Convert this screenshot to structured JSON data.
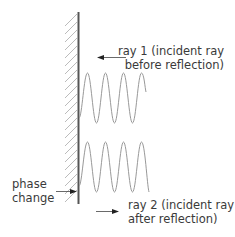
{
  "diagram": {
    "labels": {
      "ray1_line1": "ray 1 (incident ray",
      "ray1_line2": "before reflection)",
      "ray2_line1": "ray 2 (incident ray",
      "ray2_line2": "after reflection)",
      "phase_line1": "phase",
      "phase_line2": "change"
    },
    "elements": {
      "wall": "hatched reflecting surface",
      "wave1": "incident wave, 4 peaks",
      "wave2": "reflected wave, 4 peaks",
      "arrow1_direction": "left",
      "arrow2_direction": "right",
      "phase_arrow_direction": "right"
    },
    "colors": {
      "wall": "#555555",
      "hatch": "#aaaaaa",
      "wave": "#999999",
      "arrow": "#222222",
      "text": "#3a3a3a"
    }
  }
}
